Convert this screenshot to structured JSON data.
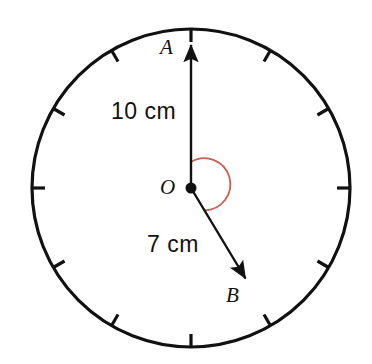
{
  "figure": {
    "type": "geometry-diagram",
    "background_color": "#ffffff",
    "stroke_color": "#111111",
    "arc_color": "#c4604f",
    "circle": {
      "center_x": 191,
      "center_y": 188,
      "radius": 159,
      "tick_count": 12,
      "tick_length": 13
    },
    "center_point": {
      "label": "O",
      "x": 191,
      "y": 188,
      "dot_radius": 5.5
    },
    "vectors": [
      {
        "name": "OA",
        "endpoint_label": "A",
        "length_label": "10 cm",
        "from_x": 191,
        "from_y": 188,
        "to_x": 191,
        "to_y": 43,
        "direction_deg": 0
      },
      {
        "name": "OB",
        "endpoint_label": "B",
        "length_label": "7 cm",
        "from_x": 191,
        "from_y": 188,
        "to_x": 248,
        "to_y": 283,
        "direction_deg": 149
      }
    ],
    "angle_arc": {
      "radius": 26,
      "start_deg": 0,
      "end_deg": 149,
      "sweep": "clockwise",
      "color": "#c4604f"
    }
  },
  "labels": {
    "point_a": "A",
    "point_b": "B",
    "point_o": "O",
    "length_oa": "10 cm",
    "length_ob": "7 cm"
  }
}
